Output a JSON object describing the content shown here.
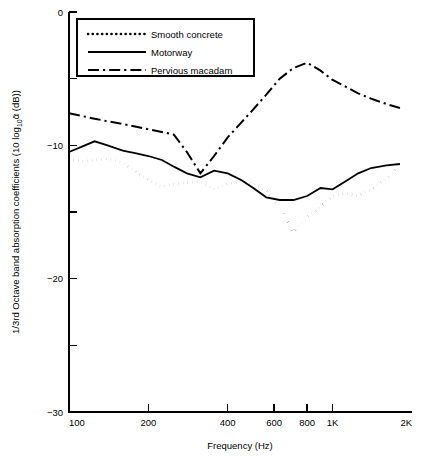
{
  "chart_data": {
    "type": "line",
    "title": "",
    "xlabel": "Frequency (Hz)",
    "ylabel": "1/3rd Octave band absorption coefficients (10 log₁₀ᾱ (dB))",
    "xscale": "log",
    "xlim": [
      100,
      2000
    ],
    "ylim": [
      -30,
      0
    ],
    "grid": false,
    "legend_position": "top-left",
    "x_ticks": [
      {
        "value": 100,
        "label": "100"
      },
      {
        "value": 200,
        "label": "200"
      },
      {
        "value": 400,
        "label": "400"
      },
      {
        "value": 600,
        "label": "600"
      },
      {
        "value": 800,
        "label": "800"
      },
      {
        "value": 1000,
        "label": "1K"
      },
      {
        "value": 2000,
        "label": "2K"
      }
    ],
    "y_ticks_major": [
      {
        "value": 0,
        "label": "0"
      },
      {
        "value": -10,
        "label": "−10"
      },
      {
        "value": -20,
        "label": "−20"
      },
      {
        "value": -30,
        "label": "−30"
      }
    ],
    "y_ticks_minor": [
      -5,
      -15,
      -25
    ],
    "series": [
      {
        "name": "Smooth concrete",
        "style": "dotted",
        "color": "#000000",
        "x": [
          100,
          112,
          125,
          140,
          160,
          180,
          200,
          225,
          250,
          280,
          315,
          355,
          400,
          450,
          500,
          560,
          630,
          710,
          800,
          900,
          1000,
          1120,
          1250,
          1400,
          1600,
          1800
        ],
        "y": [
          -11.0,
          -11.2,
          -11.1,
          -11.0,
          -11.3,
          -12.0,
          -12.6,
          -13.1,
          -12.9,
          -12.8,
          -12.7,
          -13.3,
          -12.9,
          -12.7,
          -12.9,
          -13.4,
          -14.6,
          -16.5,
          -15.4,
          -14.6,
          -13.8,
          -13.6,
          -13.8,
          -13.3,
          -12.5,
          -11.5
        ]
      },
      {
        "name": "Motorway",
        "style": "solid",
        "color": "#000000",
        "x": [
          100,
          112,
          125,
          140,
          160,
          180,
          200,
          225,
          250,
          280,
          315,
          355,
          400,
          450,
          500,
          560,
          630,
          710,
          800,
          900,
          1000,
          1120,
          1250,
          1400,
          1600,
          1800
        ],
        "y": [
          -10.5,
          -10.1,
          -9.7,
          -10.0,
          -10.4,
          -10.6,
          -10.8,
          -11.1,
          -11.6,
          -12.1,
          -12.4,
          -11.9,
          -12.1,
          -12.6,
          -13.2,
          -13.9,
          -14.1,
          -14.1,
          -13.8,
          -13.2,
          -13.3,
          -12.7,
          -12.1,
          -11.7,
          -11.5,
          -11.4
        ]
      },
      {
        "name": "Pervious macadam",
        "style": "dash-dot",
        "color": "#000000",
        "x": [
          100,
          112,
          125,
          140,
          160,
          180,
          200,
          225,
          250,
          280,
          315,
          355,
          400,
          450,
          500,
          560,
          630,
          710,
          800,
          900,
          1000,
          1120,
          1250,
          1400,
          1600,
          1800
        ],
        "y": [
          -7.6,
          -7.8,
          -8.0,
          -8.2,
          -8.4,
          -8.6,
          -8.8,
          -9.0,
          -9.2,
          -10.5,
          -12.1,
          -10.8,
          -9.4,
          -8.3,
          -7.3,
          -6.2,
          -5.0,
          -4.2,
          -3.8,
          -4.4,
          -5.1,
          -5.6,
          -6.1,
          -6.5,
          -6.9,
          -7.2
        ]
      }
    ]
  },
  "legend": {
    "entries": [
      {
        "label": "Smooth concrete",
        "style": "dotted"
      },
      {
        "label": "Motorway",
        "style": "solid"
      },
      {
        "label": "Pervious macadam",
        "style": "dash-dot"
      }
    ]
  }
}
